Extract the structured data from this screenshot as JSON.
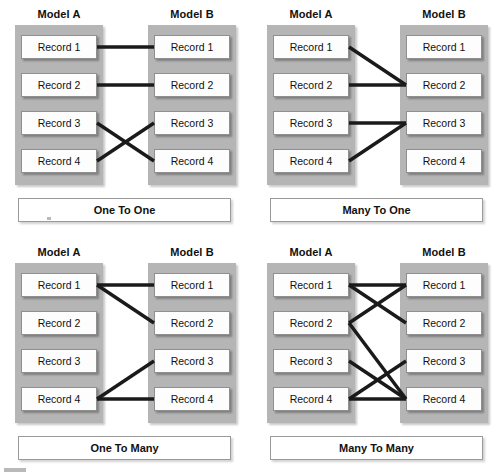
{
  "diagram": {
    "record_labels": [
      "Record 1",
      "Record 2",
      "Record 3",
      "Record 4"
    ],
    "model_a_label": "Model A",
    "model_b_label": "Model B",
    "colors": {
      "panel": "#b5b5b5",
      "record_box": "#fdfdfd",
      "record_border": "#8f8f8f",
      "link": "#1a1a1a",
      "background": "#ffffff"
    },
    "panels": [
      {
        "id": "one-to-one",
        "caption": "One To One",
        "position": "top-left",
        "model_a": {
          "label": "Model A",
          "records": [
            "Record 1",
            "Record 2",
            "Record 3",
            "Record 4"
          ]
        },
        "model_b": {
          "label": "Model B",
          "records": [
            "Record 1",
            "Record 2",
            "Record 3",
            "Record 4"
          ]
        },
        "links": [
          {
            "from": 0,
            "to": 0
          },
          {
            "from": 1,
            "to": 1
          },
          {
            "from": 2,
            "to": 3
          },
          {
            "from": 3,
            "to": 2
          }
        ]
      },
      {
        "id": "many-to-one",
        "caption": "Many To One",
        "position": "top-right",
        "model_a": {
          "label": "Model A",
          "records": [
            "Record 1",
            "Record 2",
            "Record 3",
            "Record 4"
          ]
        },
        "model_b": {
          "label": "Model B",
          "records": [
            "Record 1",
            "Record 2",
            "Record 3",
            "Record 4"
          ]
        },
        "links": [
          {
            "from": 0,
            "to": 1
          },
          {
            "from": 1,
            "to": 1
          },
          {
            "from": 2,
            "to": 2
          },
          {
            "from": 3,
            "to": 2
          }
        ]
      },
      {
        "id": "one-to-many",
        "caption": "One To Many",
        "position": "bottom-left",
        "model_a": {
          "label": "Model A",
          "records": [
            "Record 1",
            "Record 2",
            "Record 3",
            "Record 4"
          ]
        },
        "model_b": {
          "label": "Model B",
          "records": [
            "Record 1",
            "Record 2",
            "Record 3",
            "Record 4"
          ]
        },
        "links": [
          {
            "from": 0,
            "to": 0
          },
          {
            "from": 0,
            "to": 1
          },
          {
            "from": 3,
            "to": 2
          },
          {
            "from": 3,
            "to": 3
          }
        ]
      },
      {
        "id": "many-to-many",
        "caption": "Many To Many",
        "position": "bottom-right",
        "model_a": {
          "label": "Model A",
          "records": [
            "Record 1",
            "Record 2",
            "Record 3",
            "Record 4"
          ]
        },
        "model_b": {
          "label": "Model B",
          "records": [
            "Record 1",
            "Record 2",
            "Record 3",
            "Record 4"
          ]
        },
        "links": [
          {
            "from": 0,
            "to": 0
          },
          {
            "from": 0,
            "to": 1
          },
          {
            "from": 1,
            "to": 0
          },
          {
            "from": 1,
            "to": 3
          },
          {
            "from": 2,
            "to": 3
          },
          {
            "from": 3,
            "to": 2
          },
          {
            "from": 3,
            "to": 3
          }
        ]
      }
    ]
  }
}
